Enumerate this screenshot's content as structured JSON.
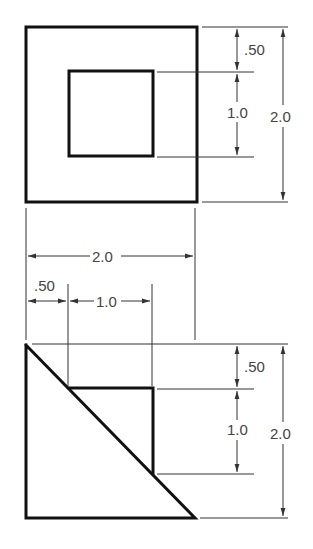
{
  "drawing": {
    "type": "orthographic-views",
    "top_view": {
      "outer_square": "2.0 x 2.0",
      "inner_square": "1.0 x 1.0",
      "dimensions": {
        "offset": ".50",
        "inner": "1.0",
        "overall": "2.0"
      }
    },
    "horizontal_dimensions": {
      "overall": "2.0",
      "offset": ".50",
      "inner": "1.0"
    },
    "front_view": {
      "shape": "right triangle with square cutout",
      "dimensions": {
        "offset": ".50",
        "inner": "1.0",
        "overall": "2.0"
      }
    }
  }
}
